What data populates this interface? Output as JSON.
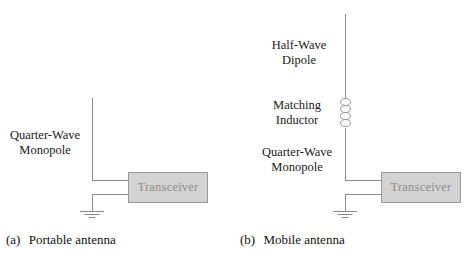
{
  "figure": {
    "panels": [
      {
        "id": "a",
        "caption_tag": "(a)",
        "caption_text": "Portable antenna",
        "labels": [
          {
            "name": "quarter-wave-monopole",
            "line1": "Quarter-Wave",
            "line2": "Monopole"
          }
        ],
        "transceiver_label": "Transceiver",
        "has_inductor": false,
        "has_ground": true
      },
      {
        "id": "b",
        "caption_tag": "(b)",
        "caption_text": "Mobile antenna",
        "labels": [
          {
            "name": "half-wave-dipole",
            "line1": "Half-Wave",
            "line2": "Dipole"
          },
          {
            "name": "matching-inductor",
            "line1": "Matching",
            "line2": "Inductor"
          },
          {
            "name": "quarter-wave-monopole",
            "line1": "Quarter-Wave",
            "line2": "Monopole"
          }
        ],
        "transceiver_label": "Transceiver",
        "has_inductor": true,
        "has_ground": true
      }
    ],
    "colors": {
      "wire": "#8c8c8c",
      "box_fill": "#d3d3d3",
      "box_border": "#9a9a9a",
      "box_text": "#8e8e8e",
      "label_text": "#1a1a1a",
      "background": "#ffffff"
    }
  }
}
